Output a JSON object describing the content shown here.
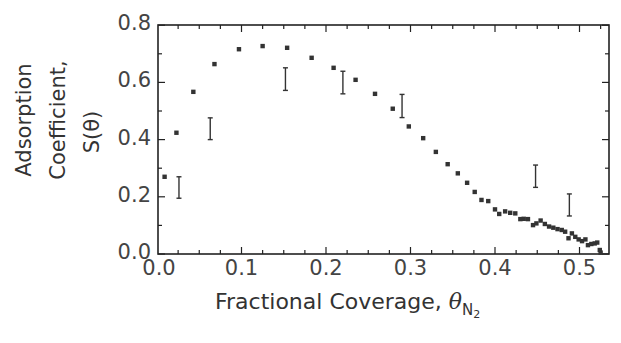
{
  "chart_data": {
    "type": "scatter",
    "title": "",
    "xlabel": "Fractional Coverage, θN2",
    "xlabel_parts": {
      "text": "Fractional Coverage,",
      "symbol": "θ",
      "subscript": "N",
      "sub_subscript": "2"
    },
    "ylabel": "Adsorption Coefficient, S(θ)",
    "ylabel_lines": [
      "Adsorption",
      "Coefficient,",
      "S(θ)"
    ],
    "xlim": [
      0.0,
      0.537
    ],
    "ylim": [
      0.0,
      0.8
    ],
    "xticks": [
      "0.0",
      "0.1",
      "0.2",
      "0.3",
      "0.4",
      "0.5"
    ],
    "xtick_values": [
      0.0,
      0.1,
      0.2,
      0.3,
      0.4,
      0.5
    ],
    "yticks": [
      "0.0",
      "0.2",
      "0.4",
      "0.6",
      "0.8"
    ],
    "ytick_values": [
      0.0,
      0.2,
      0.4,
      0.6,
      0.8
    ],
    "grid": false,
    "legend": null,
    "series": [
      {
        "name": "S(θ) measurements",
        "marker": "square",
        "x": [
          0.009,
          0.023,
          0.043,
          0.068,
          0.097,
          0.125,
          0.154,
          0.183,
          0.209,
          0.235,
          0.258,
          0.279,
          0.298,
          0.315,
          0.33,
          0.344,
          0.356,
          0.367,
          0.376,
          0.384,
          0.392,
          0.4,
          0.405,
          0.412,
          0.418,
          0.424,
          0.43,
          0.434,
          0.439,
          0.445,
          0.449,
          0.454,
          0.459,
          0.464,
          0.469,
          0.474,
          0.479,
          0.483,
          0.487,
          0.491,
          0.495,
          0.499,
          0.503,
          0.507,
          0.51,
          0.514,
          0.518,
          0.521,
          0.524,
          0.525
        ],
        "y": [
          0.27,
          0.424,
          0.567,
          0.664,
          0.716,
          0.727,
          0.721,
          0.686,
          0.651,
          0.609,
          0.56,
          0.508,
          0.446,
          0.405,
          0.357,
          0.314,
          0.282,
          0.249,
          0.217,
          0.189,
          0.185,
          0.156,
          0.14,
          0.149,
          0.144,
          0.142,
          0.122,
          0.123,
          0.122,
          0.101,
          0.107,
          0.117,
          0.105,
          0.096,
          0.092,
          0.087,
          0.084,
          0.078,
          0.055,
          0.072,
          0.06,
          0.051,
          0.045,
          0.051,
          0.031,
          0.035,
          0.037,
          0.04,
          0.014,
          0.005
        ]
      },
      {
        "name": "error range bars",
        "marker": "errorbar",
        "bars": [
          {
            "x": 0.026,
            "low": 0.195,
            "high": 0.27
          },
          {
            "x": 0.063,
            "low": 0.4,
            "high": 0.476
          },
          {
            "x": 0.152,
            "low": 0.572,
            "high": 0.651
          },
          {
            "x": 0.22,
            "low": 0.56,
            "high": 0.639
          },
          {
            "x": 0.29,
            "low": 0.477,
            "high": 0.558
          },
          {
            "x": 0.448,
            "low": 0.233,
            "high": 0.311
          },
          {
            "x": 0.488,
            "low": 0.133,
            "high": 0.21
          }
        ]
      }
    ],
    "style": {
      "axis_color": "#222222",
      "marker_color": "#333333",
      "text_color": "#333333"
    }
  }
}
